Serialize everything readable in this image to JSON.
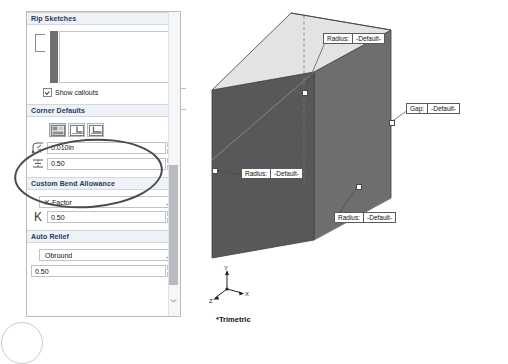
{
  "panel": {
    "sections": [
      {
        "id": "rip-sketches",
        "title": "Rip Sketches",
        "checkbox_label": "Show callouts",
        "checkbox_checked": true
      },
      {
        "id": "corner-defaults",
        "title": "Corner Defaults",
        "buttons": [
          {
            "name": "corner-type-closed",
            "selected": true
          },
          {
            "name": "corner-type-overlap",
            "selected": false
          },
          {
            "name": "corner-type-underlap",
            "selected": false
          }
        ],
        "fields": [
          {
            "icon": "corner-radius-icon",
            "value": "0.010in"
          },
          {
            "icon": "corner-gap-icon",
            "value": "0.50"
          }
        ]
      },
      {
        "id": "custom-bend-allowance",
        "title": "Custom Bend Allowance",
        "dropdown_value": "K-Factor",
        "k_symbol": "K",
        "k_value": "0.50"
      },
      {
        "id": "auto-relief",
        "title": "Auto Relief",
        "dropdown_value": "Obround",
        "ratio_value": "0.50"
      }
    ]
  },
  "viewport": {
    "view_label": "*Trimetric",
    "triad": {
      "x": "X",
      "y": "Y",
      "z": "Z"
    },
    "callouts": [
      {
        "id": "callout-radius-top",
        "label": "Radius:",
        "value": "-Default-"
      },
      {
        "id": "callout-gap-right",
        "label": "Gap:",
        "value": "-Default-"
      },
      {
        "id": "callout-radius-left",
        "label": "Radius:",
        "value": "-Default-"
      },
      {
        "id": "callout-radius-bottom",
        "label": "Radius:",
        "value": "-Default-"
      }
    ]
  },
  "colors": {
    "face_top": "#e3e3e1",
    "face_left": "#58585a",
    "face_right": "#6e6e70",
    "header_text": "#1d3b63",
    "header_bg": "#eef1f5"
  }
}
